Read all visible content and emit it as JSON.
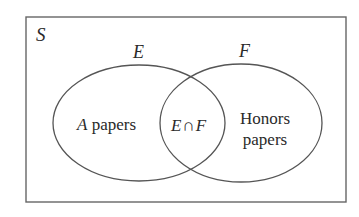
{
  "diagram": {
    "type": "venn",
    "universe": {
      "label": "S"
    },
    "sets": [
      {
        "id": "E",
        "label": "E",
        "region_label_italic": "A",
        "region_label": " papers"
      },
      {
        "id": "F",
        "label": "F",
        "region_label_line1": "Honors",
        "region_label_line2": "papers"
      }
    ],
    "intersection": {
      "left": "E",
      "symbol": "∩",
      "right": "F"
    },
    "colors": {
      "stroke": "#555555",
      "text": "#2a2a2a",
      "background": "#ffffff"
    }
  }
}
